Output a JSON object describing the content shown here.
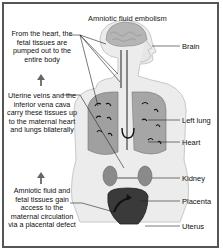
{
  "title": "Amniotic fluid embolism",
  "notes": [
    {
      "id": "pumped",
      "text": "From the heart, the fetal tissues are pumped out to the entire body"
    },
    {
      "id": "veins",
      "text": "Uterine veins and the inferior vena cava carry these tissues up to the maternal heart and lungs bilaterally"
    },
    {
      "id": "access",
      "text": "Amniotic fluid and fetal tissues gain access to the maternal circulation via a placental defect"
    }
  ],
  "labels": {
    "brain": "Brain",
    "left_lung": "Left lung",
    "heart": "Heart",
    "kidney": "Kidney",
    "placenta": "Placenta",
    "uterus": "Uterus"
  },
  "icons": [
    "up-arrow-icon",
    "up-arrow-icon"
  ],
  "colors": {
    "frame": "#555555",
    "body": "#e6e6e6",
    "lung": "#9a9a9a",
    "uterus": "#3a3a3a",
    "text": "#111111"
  }
}
